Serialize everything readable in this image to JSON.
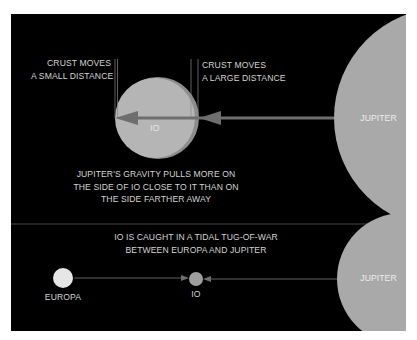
{
  "diagram": {
    "top": {
      "crust_small": [
        "CRUST MOVES",
        "A SMALL DISTANCE"
      ],
      "crust_large": [
        "CRUST MOVES",
        "A LARGE DISTANCE"
      ],
      "io_label": "IO",
      "jupiter_label": "JUPITER",
      "caption": [
        "JUPITER'S GRAVITY PULLS MORE ON",
        "THE SIDE OF IO CLOSE TO IT THAN ON",
        "THE SIDE FARTHER AWAY"
      ]
    },
    "bottom": {
      "caption": [
        "IO IS CAUGHT IN A TIDAL TUG-OF-WAR",
        "BETWEEN EUROPA AND JUPITER"
      ],
      "europa_label": "EUROPA",
      "io_label": "IO",
      "jupiter_label": "JUPITER"
    },
    "colors": {
      "background": "#000000",
      "jupiter": "#a9a9a9",
      "io": "#b3b3b3",
      "europa": "#e6e6e6",
      "arrow": "#6e6e6e",
      "text": "#d4d4d4"
    }
  }
}
